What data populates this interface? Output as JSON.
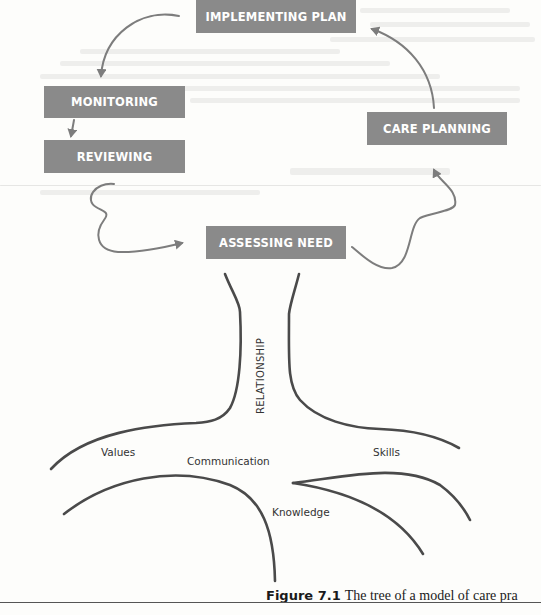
{
  "figure": {
    "caption_number": "Figure 7.1",
    "caption_text": "The tree of a model of care pra"
  },
  "cycle": {
    "stages": [
      {
        "id": "implementing-plan",
        "label": "IMPLEMENTING PLAN"
      },
      {
        "id": "monitoring",
        "label": "MONITORING"
      },
      {
        "id": "reviewing",
        "label": "REVIEWING"
      },
      {
        "id": "assessing-need",
        "label": "ASSESSING NEED"
      },
      {
        "id": "care-planning",
        "label": "CARE PLANNING"
      }
    ],
    "flow": [
      "IMPLEMENTING PLAN -> MONITORING",
      "MONITORING -> REVIEWING",
      "REVIEWING -> ASSESSING NEED",
      "ASSESSING NEED -> CARE PLANNING",
      "CARE PLANNING -> IMPLEMENTING PLAN"
    ]
  },
  "tree": {
    "trunk_label": "RELATIONSHIP",
    "roots": [
      {
        "label": "Values"
      },
      {
        "label": "Communication"
      },
      {
        "label": "Skills"
      },
      {
        "label": "Knowledge"
      }
    ]
  },
  "colors": {
    "box_fill": "#8a8a8a",
    "box_text": "#ffffff",
    "arrow": "#7d7d7d",
    "tree_line": "#4a4a4a",
    "background": "#fdfdfb"
  }
}
